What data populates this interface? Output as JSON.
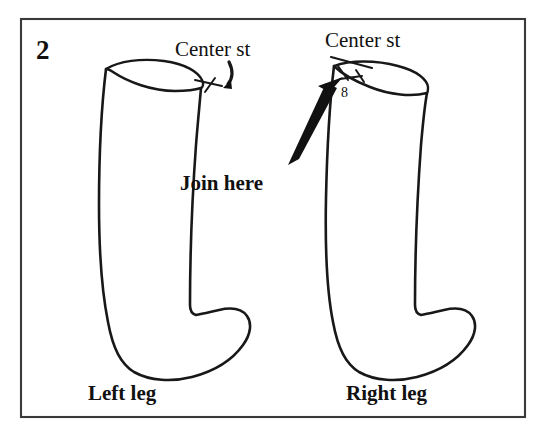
{
  "figure": {
    "number": "2",
    "frame": {
      "border_color": "#3a3a3a",
      "background": "#ffffff"
    },
    "ink_color": "#181818",
    "labels": {
      "center_st_left": "Center st",
      "center_st_right": "Center st",
      "join_here": "Join here",
      "stitch_count": "8",
      "left_leg": "Left leg",
      "right_leg": "Right leg"
    },
    "annotations": [
      {
        "name": "center-st-left-pointer",
        "text": "Center st",
        "points_to": "left-boot-top-right-corner",
        "marker": "hook-arrow"
      },
      {
        "name": "center-st-right-pointer",
        "text": "Center st",
        "points_to": "right-boot-top-left-corner",
        "marker": "line"
      },
      {
        "name": "stitch-span-8",
        "text": "8",
        "marker": "double-tick-span"
      },
      {
        "name": "join-here-arrow",
        "text": "Join here",
        "points_to": "right-boot-top-left-corner",
        "marker": "thick-solid-arrow"
      }
    ],
    "objects": [
      {
        "name": "left-boot",
        "caption": "Left leg",
        "rim_tilt": "down-right"
      },
      {
        "name": "right-boot",
        "caption": "Right leg",
        "rim_tilt": "down-right-mirrored"
      }
    ]
  }
}
